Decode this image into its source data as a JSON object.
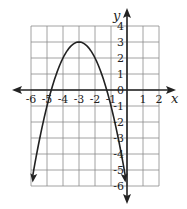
{
  "chart_data": {
    "type": "line",
    "title": "",
    "xlabel": "x",
    "ylabel": "y",
    "xlim": [
      -6,
      2
    ],
    "ylim": [
      -6,
      4
    ],
    "grid": true,
    "x_ticks": [
      "-6",
      "-5",
      "-4",
      "-3",
      "-2",
      "-1",
      "1",
      "2"
    ],
    "y_ticks": [
      "4",
      "3",
      "2",
      "1",
      "0",
      "-1",
      "-2",
      "-3",
      "-4",
      "-5",
      "-6"
    ],
    "series": [
      {
        "name": "y = -(x+3)^2 + 3",
        "equation": "y = -(x + 3)^2 + 3",
        "vertex": [
          -3,
          3
        ],
        "x_intercepts": [
          -4.73,
          -1.27
        ],
        "endpoints": [
          [
            -6,
            -6
          ],
          [
            0,
            -6
          ]
        ],
        "x": [
          -6,
          -5,
          -4,
          -3,
          -2,
          -1,
          0
        ],
        "values": [
          -6,
          -1,
          2,
          3,
          2,
          -1,
          -6
        ]
      }
    ]
  },
  "labels": {
    "x_axis": "x",
    "y_axis": "y",
    "x_ticks": [
      {
        "v": -6,
        "t": "-6"
      },
      {
        "v": -5,
        "t": "-5"
      },
      {
        "v": -4,
        "t": "-4"
      },
      {
        "v": -3,
        "t": "-3"
      },
      {
        "v": -2,
        "t": "-2"
      },
      {
        "v": -1,
        "t": "-1"
      },
      {
        "v": 1,
        "t": "1"
      },
      {
        "v": 2,
        "t": "2"
      }
    ],
    "y_ticks": [
      {
        "v": 4,
        "t": "4"
      },
      {
        "v": 3,
        "t": "3"
      },
      {
        "v": 2,
        "t": "2"
      },
      {
        "v": 1,
        "t": "1"
      },
      {
        "v": 0,
        "t": "0"
      },
      {
        "v": -1,
        "t": "-1"
      },
      {
        "v": -2,
        "t": "-2"
      },
      {
        "v": -3,
        "t": "-3"
      },
      {
        "v": -4,
        "t": "-4"
      },
      {
        "v": -5,
        "t": "-5"
      },
      {
        "v": -6,
        "t": "-6"
      }
    ]
  },
  "colors": {
    "grid": "#8a8a8a",
    "axis": "#222222",
    "curve": "#222222"
  }
}
